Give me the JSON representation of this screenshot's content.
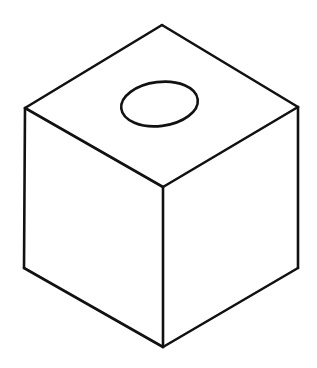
{
  "figure": {
    "title": "Isometric cube with circular hole in top face",
    "type": "line-drawing",
    "background_color": "#ffffff",
    "stroke_color": "#111111",
    "fill_color": "#ffffff",
    "stroke_width": 2.6,
    "canvas": {
      "width": 317,
      "height": 368
    }
  },
  "geometry": {
    "vertices": {
      "top_apex": {
        "name": "top-rear-vertex",
        "x": 162,
        "y": 25
      },
      "left_upper": {
        "name": "left-upper-vertex",
        "x": 25,
        "y": 108
      },
      "right_upper": {
        "name": "right-upper-vertex",
        "x": 298,
        "y": 107
      },
      "center": {
        "name": "front-top-vertex",
        "x": 163,
        "y": 187
      },
      "left_lower": {
        "name": "left-lower-vertex",
        "x": 24,
        "y": 268
      },
      "right_lower": {
        "name": "right-lower-vertex",
        "x": 298,
        "y": 268
      },
      "bottom_apex": {
        "name": "bottom-front-vertex",
        "x": 163,
        "y": 347
      }
    },
    "faces": [
      {
        "id": "top-face",
        "label": "Top face",
        "points": "162,25 298,107 163,187 25,108"
      },
      {
        "id": "left-face",
        "label": "Left face",
        "points": "25,108 163,187 163,347 24,268"
      },
      {
        "id": "right-face",
        "label": "Right face",
        "points": "163,187 298,107 298,268 163,347"
      }
    ],
    "edges": [
      {
        "id": "edge-top-rear-left",
        "label": "Top rear left edge",
        "x1": 162,
        "y1": 25,
        "x2": 25,
        "y2": 108
      },
      {
        "id": "edge-top-rear-right",
        "label": "Top rear right edge",
        "x1": 162,
        "y1": 25,
        "x2": 298,
        "y2": 107
      },
      {
        "id": "edge-top-front-left",
        "label": "Top front left edge",
        "x1": 25,
        "y1": 108,
        "x2": 163,
        "y2": 187
      },
      {
        "id": "edge-top-front-right",
        "label": "Top front right edge",
        "x1": 298,
        "y1": 107,
        "x2": 163,
        "y2": 187
      },
      {
        "id": "edge-vertical-left",
        "label": "Left vertical edge",
        "x1": 25,
        "y1": 108,
        "x2": 24,
        "y2": 268
      },
      {
        "id": "edge-vertical-center",
        "label": "Center vertical edge",
        "x1": 163,
        "y1": 187,
        "x2": 163,
        "y2": 347
      },
      {
        "id": "edge-vertical-right",
        "label": "Right vertical edge",
        "x1": 298,
        "y1": 107,
        "x2": 298,
        "y2": 268
      },
      {
        "id": "edge-bottom-left",
        "label": "Bottom left edge",
        "x1": 24,
        "y1": 268,
        "x2": 163,
        "y2": 347
      },
      {
        "id": "edge-bottom-right",
        "label": "Bottom right edge",
        "x1": 298,
        "y1": 268,
        "x2": 163,
        "y2": 347
      }
    ],
    "hole": {
      "id": "top-face-hole",
      "label": "Circular hole on top face (drawn as ellipse)",
      "shape": "ellipse",
      "cx": 159.5,
      "cy": 104,
      "rx": 38.5,
      "ry": 22,
      "rotation_deg": -7
    }
  }
}
